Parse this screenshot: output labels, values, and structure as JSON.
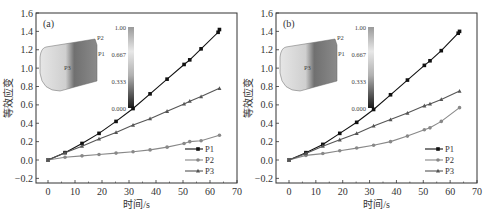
{
  "chart_data": [
    {
      "type": "line",
      "panel_label": "(a)",
      "xlabel": "时间/s",
      "ylabel": "等效应变",
      "xlim": [
        -5,
        70
      ],
      "ylim": [
        -0.25,
        1.6
      ],
      "xticks": [
        0,
        10,
        20,
        30,
        40,
        50,
        60,
        70
      ],
      "yticks": [
        -0.2,
        0.0,
        0.2,
        0.4,
        0.6,
        0.8,
        1.0,
        1.2,
        1.4,
        1.6
      ],
      "legend": [
        "P1",
        "P2",
        "P3"
      ],
      "legend_position": "lower right",
      "inset": {
        "colorbar_ticks": [
          "1.00",
          "0.667",
          "0.333",
          "0.000"
        ],
        "point_labels": [
          "P2",
          "P1",
          "P3"
        ]
      },
      "series": [
        {
          "name": "P1",
          "marker": "square",
          "color": "#111111",
          "x": [
            0,
            6.3,
            12.6,
            18.9,
            25.2,
            31.5,
            37.8,
            44.1,
            50.4,
            52.5,
            56.7,
            63.0,
            63.5
          ],
          "y": [
            0.0,
            0.08,
            0.18,
            0.29,
            0.42,
            0.56,
            0.72,
            0.88,
            1.04,
            1.09,
            1.21,
            1.39,
            1.42
          ]
        },
        {
          "name": "P2",
          "marker": "circle",
          "color": "#888888",
          "x": [
            0,
            6.3,
            12.6,
            18.9,
            25.2,
            31.5,
            37.8,
            44.1,
            50.4,
            52.5,
            56.7,
            63.5
          ],
          "y": [
            0.0,
            0.03,
            0.045,
            0.06,
            0.075,
            0.09,
            0.11,
            0.14,
            0.18,
            0.2,
            0.21,
            0.27
          ]
        },
        {
          "name": "P3",
          "marker": "triangle",
          "color": "#555555",
          "x": [
            0,
            6.3,
            12.6,
            18.9,
            25.2,
            31.5,
            37.8,
            44.1,
            50.4,
            52.5,
            56.7,
            63.5
          ],
          "y": [
            0.0,
            0.08,
            0.15,
            0.23,
            0.3,
            0.38,
            0.45,
            0.53,
            0.61,
            0.64,
            0.69,
            0.78
          ]
        }
      ]
    },
    {
      "type": "line",
      "panel_label": "(b)",
      "xlabel": "时间/s",
      "ylabel": "等效应变",
      "xlim": [
        -5,
        70
      ],
      "ylim": [
        -0.25,
        1.6
      ],
      "xticks": [
        0,
        10,
        20,
        30,
        40,
        50,
        60,
        70
      ],
      "yticks": [
        -0.2,
        0.0,
        0.2,
        0.4,
        0.6,
        0.8,
        1.0,
        1.2,
        1.4,
        1.6
      ],
      "legend": [
        "P1",
        "P2",
        "P3"
      ],
      "legend_position": "lower right",
      "inset": {
        "colorbar_ticks": [
          "1.00",
          "0.667",
          "0.333",
          "0.000"
        ],
        "point_labels": [
          "P2",
          "P1",
          "P3"
        ]
      },
      "series": [
        {
          "name": "P1",
          "marker": "square",
          "color": "#111111",
          "x": [
            0,
            6.3,
            12.6,
            18.9,
            25.2,
            31.5,
            37.8,
            44.1,
            50.4,
            52.5,
            56.7,
            63.0,
            63.5
          ],
          "y": [
            0.0,
            0.08,
            0.17,
            0.29,
            0.41,
            0.55,
            0.71,
            0.87,
            1.03,
            1.08,
            1.19,
            1.38,
            1.4
          ]
        },
        {
          "name": "P2",
          "marker": "circle",
          "color": "#888888",
          "x": [
            0,
            6.3,
            12.6,
            18.9,
            25.2,
            31.5,
            37.8,
            44.1,
            50.4,
            52.5,
            56.7,
            63.5
          ],
          "y": [
            0.0,
            0.05,
            0.07,
            0.1,
            0.13,
            0.16,
            0.2,
            0.26,
            0.33,
            0.35,
            0.42,
            0.57
          ]
        },
        {
          "name": "P3",
          "marker": "triangle",
          "color": "#555555",
          "x": [
            0,
            6.3,
            12.6,
            18.9,
            25.2,
            31.5,
            37.8,
            44.1,
            50.4,
            52.5,
            56.7,
            63.5
          ],
          "y": [
            0.0,
            0.07,
            0.15,
            0.22,
            0.29,
            0.37,
            0.44,
            0.51,
            0.59,
            0.61,
            0.66,
            0.75
          ]
        }
      ]
    }
  ]
}
